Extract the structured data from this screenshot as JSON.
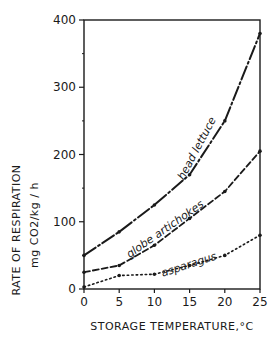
{
  "chart_data": {
    "type": "line",
    "title": "",
    "xlabel": "STORAGE TEMPERATURE,°C",
    "ylabel": "RATE OF RESPIRATION",
    "ylabel_units": "mg CO2/kg / h",
    "x": [
      0,
      5,
      10,
      15,
      20,
      25
    ],
    "xlim": [
      0,
      25
    ],
    "ylim": [
      0,
      400
    ],
    "xticks": [
      "0",
      "5",
      "10",
      "15",
      "20",
      "25"
    ],
    "yticks": [
      "0",
      "100",
      "200",
      "300",
      "400"
    ],
    "grid": false,
    "legend": "inline labels",
    "series": [
      {
        "name": "head lettuce",
        "style": "dash-dot",
        "values": [
          50,
          85,
          125,
          170,
          250,
          380
        ]
      },
      {
        "name": "globe artichokes",
        "style": "dashed",
        "values": [
          25,
          35,
          65,
          105,
          145,
          205
        ]
      },
      {
        "name": "asparagus",
        "style": "dotted",
        "values": [
          3,
          20,
          22,
          35,
          50,
          80
        ]
      }
    ]
  }
}
